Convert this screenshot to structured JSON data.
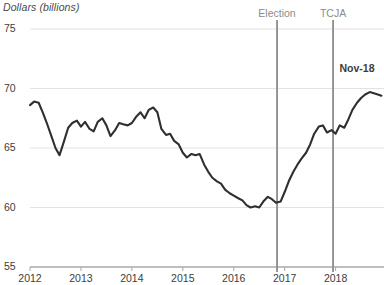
{
  "chart_data": {
    "type": "line",
    "title": "",
    "ylabel": "Dollars (billions)",
    "xlabel": "",
    "ylim": [
      55,
      75
    ],
    "xlim": [
      2012.0,
      2018.95
    ],
    "yticks": [
      "55",
      "60",
      "65",
      "70",
      "75"
    ],
    "ytick_values": [
      55,
      60,
      65,
      70,
      75
    ],
    "xticks": [
      "2012",
      "2013",
      "2014",
      "2015",
      "2016",
      "2017",
      "2018"
    ],
    "xtick_values": [
      2012,
      2013,
      2014,
      2015,
      2016,
      2017,
      2018
    ],
    "grid": "horizontal",
    "legend": "none",
    "line_color": "#2f2f2f",
    "grid_color": "#e2e2e2",
    "marker_line_color": "#8c8c8c",
    "annotations": [
      {
        "label": "Election",
        "x": 2016.85,
        "kind": "vertical-rule"
      },
      {
        "label": "TCJA",
        "x": 2017.95,
        "kind": "vertical-rule"
      },
      {
        "label": "Nov-18",
        "x": 2018.9,
        "y": 71.6,
        "kind": "endpoint-text"
      }
    ],
    "series": [
      {
        "name": "Dollars (billions)",
        "x": [
          2012.0,
          2012.08,
          2012.17,
          2012.25,
          2012.33,
          2012.42,
          2012.5,
          2012.58,
          2012.67,
          2012.75,
          2012.83,
          2012.92,
          2013.0,
          2013.08,
          2013.17,
          2013.25,
          2013.33,
          2013.42,
          2013.5,
          2013.58,
          2013.67,
          2013.75,
          2013.83,
          2013.92,
          2014.0,
          2014.08,
          2014.17,
          2014.25,
          2014.33,
          2014.42,
          2014.5,
          2014.58,
          2014.67,
          2014.75,
          2014.83,
          2014.92,
          2015.0,
          2015.08,
          2015.17,
          2015.25,
          2015.33,
          2015.42,
          2015.5,
          2015.58,
          2015.67,
          2015.75,
          2015.83,
          2015.92,
          2016.0,
          2016.08,
          2016.17,
          2016.25,
          2016.33,
          2016.42,
          2016.5,
          2016.58,
          2016.67,
          2016.75,
          2016.83,
          2016.92,
          2017.0,
          2017.08,
          2017.17,
          2017.25,
          2017.33,
          2017.42,
          2017.5,
          2017.58,
          2017.67,
          2017.75,
          2017.83,
          2017.92,
          2018.0,
          2018.08,
          2018.17,
          2018.25,
          2018.33,
          2018.42,
          2018.5,
          2018.58,
          2018.67,
          2018.75,
          2018.83,
          2018.9
        ],
        "values": [
          68.6,
          68.9,
          68.8,
          68.0,
          67.1,
          66.0,
          65.0,
          64.4,
          65.6,
          66.7,
          67.1,
          67.3,
          66.8,
          67.2,
          66.6,
          66.4,
          67.2,
          67.5,
          66.9,
          66.0,
          66.5,
          67.1,
          67.0,
          66.9,
          67.1,
          67.6,
          68.0,
          67.5,
          68.2,
          68.4,
          68.0,
          66.6,
          66.1,
          66.2,
          65.6,
          65.3,
          64.6,
          64.2,
          64.5,
          64.4,
          64.5,
          63.6,
          63.0,
          62.5,
          62.2,
          62.0,
          61.5,
          61.2,
          61.0,
          60.8,
          60.6,
          60.2,
          60.0,
          60.1,
          60.0,
          60.5,
          60.9,
          60.7,
          60.4,
          60.5,
          61.3,
          62.2,
          63.0,
          63.6,
          64.1,
          64.6,
          65.3,
          66.2,
          66.8,
          66.9,
          66.3,
          66.5,
          66.2,
          66.9,
          66.7,
          67.4,
          68.2,
          68.8,
          69.2,
          69.5,
          69.7,
          69.6,
          69.5,
          69.4
        ]
      }
    ]
  }
}
